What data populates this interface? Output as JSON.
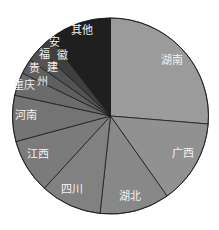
{
  "chart_data": {
    "type": "pie",
    "title": "",
    "start_angle_deg": 0,
    "direction": "clockwise",
    "legend": "none",
    "center": [
      110.5,
      116
    ],
    "radius": 98,
    "slices": [
      {
        "label": "湖南",
        "value": 26.3,
        "color": "#9b9b9b",
        "label_pos": [
          172,
          64
        ],
        "vertical": false
      },
      {
        "label": "广西",
        "value": 13.9,
        "color": "#919191",
        "label_pos": [
          183,
          157
        ],
        "vertical": false
      },
      {
        "label": "湖北",
        "value": 11.5,
        "color": "#888888",
        "label_pos": [
          130,
          200
        ],
        "vertical": false
      },
      {
        "label": "四川",
        "value": 10.1,
        "color": "#818181",
        "label_pos": [
          72,
          193
        ],
        "vertical": false
      },
      {
        "label": "江西",
        "value": 9.0,
        "color": "#7b7b7b",
        "label_pos": [
          38,
          158
        ],
        "vertical": false
      },
      {
        "label": "河南",
        "value": 7.6,
        "color": "#747474",
        "label_pos": [
          26,
          119
        ],
        "vertical": false
      },
      {
        "label": "重庆",
        "value": 3.8,
        "color": "#6b6b6b",
        "label_pos": [
          24,
          89
        ],
        "vertical": false
      },
      {
        "label": "贵州",
        "value": 2.5,
        "color": "#5f5f5f",
        "label_pos": [
          34,
          72
        ],
        "vertical": true
      },
      {
        "label": "福建",
        "value": 2.3,
        "color": "#535353",
        "label_pos": [
          44,
          58
        ],
        "vertical": true
      },
      {
        "label": "安徽",
        "value": 2.5,
        "color": "#3f3f3f",
        "label_pos": [
          54,
          46
        ],
        "vertical": true
      },
      {
        "label": "其他",
        "value": 10.5,
        "color": "#1f1f1f",
        "label_pos": [
          82,
          34
        ],
        "vertical": false
      }
    ],
    "stroke_color": "#1a1a1a"
  }
}
